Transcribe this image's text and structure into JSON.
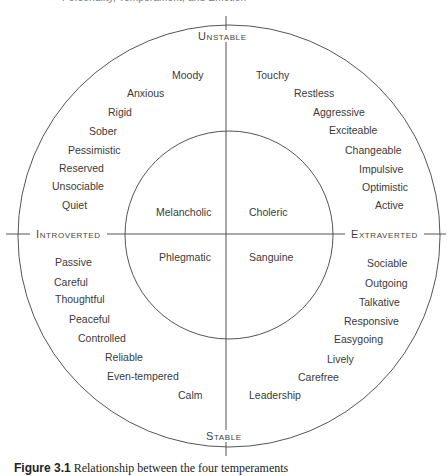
{
  "header": {
    "running_head": "Personality, Temperament, and Emotion"
  },
  "diagram": {
    "axes": {
      "top": "Unstable",
      "bottom": "Stable",
      "left": "Introverted",
      "right": "Extraverted"
    },
    "temperaments": {
      "upper_left": "Melancholic",
      "upper_right": "Choleric",
      "lower_left": "Phlegmatic",
      "lower_right": "Sanguine"
    },
    "traits": {
      "unstable_introverted": [
        "Moody",
        "Anxious",
        "Rigid",
        "Sober",
        "Pessimistic",
        "Reserved",
        "Unsociable",
        "Quiet"
      ],
      "unstable_extraverted": [
        "Touchy",
        "Restless",
        "Aggressive",
        "Exciteable",
        "Changeable",
        "Impulsive",
        "Optimistic",
        "Active"
      ],
      "stable_introverted": [
        "Passive",
        "Careful",
        "Thoughtful",
        "Peaceful",
        "Controlled",
        "Reliable",
        "Even-tempered",
        "Calm"
      ],
      "stable_extraverted": [
        "Sociable",
        "Outgoing",
        "Talkative",
        "Responsive",
        "Easygoing",
        "Lively",
        "Carefree",
        "Leadership"
      ]
    },
    "colors": {
      "line": "#555555",
      "text": "#3a3a3a"
    }
  },
  "caption": {
    "label": "Figure 3.1",
    "text": "Relationship between the four temperaments"
  }
}
